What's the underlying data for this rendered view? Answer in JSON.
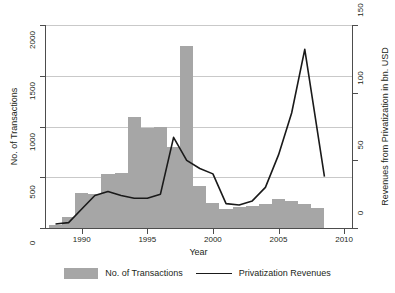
{
  "chart_data": {
    "type": "bar",
    "title": "",
    "subtitle": "",
    "xlabel": "Year",
    "ylabel": "No. of Transactions",
    "y2label": "Revenues from Privatization in bn. USD",
    "grid": true,
    "legend_position": "bottom",
    "xlim": [
      1987.2,
      2010.6
    ],
    "ylim": [
      0,
      2000
    ],
    "y2lim": [
      0,
      150
    ],
    "xticks": [
      1990,
      1995,
      2000,
      2005,
      2010
    ],
    "xticklabels": [
      "1990",
      "1995",
      "2000",
      "2005",
      "2010"
    ],
    "yticks": [
      0,
      500,
      1000,
      1500,
      2000
    ],
    "yticklabels": [
      "0",
      "500",
      "1000",
      "1500",
      "2000"
    ],
    "y2ticks": [
      0,
      50,
      100,
      150
    ],
    "y2ticklabels": [
      "0",
      "50",
      "100",
      "150"
    ],
    "colors": {
      "bar": "#a6a6a6",
      "line": "#1a1a1a",
      "grid": "#c9c9c9",
      "axis": "#4d4d4d",
      "text": "#231f20",
      "background": "#ffffff"
    },
    "series": [
      {
        "name": "No. of Transactions",
        "type": "bar",
        "axis": "left",
        "x": [
          1988,
          1989,
          1990,
          1991,
          1992,
          1993,
          1994,
          1995,
          1996,
          1997,
          1998,
          1999,
          2000,
          2001,
          2002,
          2003,
          2004,
          2005,
          2006,
          2007,
          2008
        ],
        "values": [
          30,
          110,
          345,
          340,
          530,
          545,
          1095,
          985,
          1000,
          795,
          1790,
          410,
          245,
          185,
          205,
          215,
          235,
          290,
          265,
          235,
          200
        ]
      },
      {
        "name": "Privatization Revenues",
        "type": "line",
        "axis": "right",
        "x": [
          1988,
          1989,
          1990,
          1991,
          1992,
          1993,
          1994,
          1995,
          1996,
          1997,
          1998,
          1999,
          2000,
          2001,
          2002,
          2003,
          2004,
          2005,
          2006,
          2007,
          2008.5
        ],
        "values": [
          3,
          4,
          14,
          24,
          27,
          24,
          22,
          22,
          25,
          67,
          50,
          44,
          40,
          18,
          17,
          20,
          30,
          54,
          85,
          132,
          38
        ]
      }
    ]
  },
  "legend": {
    "items": [
      {
        "label": "No. of Transactions",
        "marker": "bar-swatch"
      },
      {
        "label": "Privatization Revenues",
        "marker": "line-swatch"
      }
    ]
  }
}
